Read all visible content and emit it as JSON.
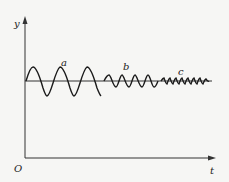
{
  "diagram": {
    "type": "damped-oscillation-waveforms",
    "axes": {
      "y_label": "y",
      "x_label": "t",
      "origin_label": "O"
    },
    "waves": [
      {
        "label": "a",
        "description": "large amplitude, low frequency",
        "amplitude_px": 14,
        "cycles": 3
      },
      {
        "label": "b",
        "description": "medium amplitude, higher frequency",
        "amplitude_px": 6,
        "cycles": 4
      },
      {
        "label": "c",
        "description": "small amplitude, highest frequency",
        "amplitude_px": 3,
        "cycles": 8
      }
    ],
    "colors": {
      "background": "#f6f6f4",
      "stroke": "#1a1a1a"
    }
  }
}
